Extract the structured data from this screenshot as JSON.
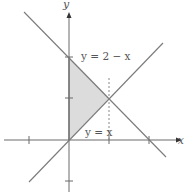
{
  "diagram": {
    "title": "",
    "axes": {
      "x_label": "x",
      "y_label": "y",
      "x_ticks": [
        -1,
        1,
        2
      ],
      "y_ticks": [
        -1,
        1,
        2
      ]
    },
    "curves": [
      {
        "label": "y = 2 − x",
        "equation": "y=2-x"
      },
      {
        "label": "y = x",
        "equation": "y=x"
      }
    ],
    "dashed_line": {
      "equation": "x=1"
    },
    "shaded_region": {
      "vertices": [
        [
          0,
          0
        ],
        [
          0,
          2
        ],
        [
          1,
          1
        ]
      ],
      "color": "#d9d9d9"
    },
    "colors": {
      "line": "#7a7a7a",
      "axis": "#6a6a6a",
      "fill": "#dcdcdc"
    }
  }
}
